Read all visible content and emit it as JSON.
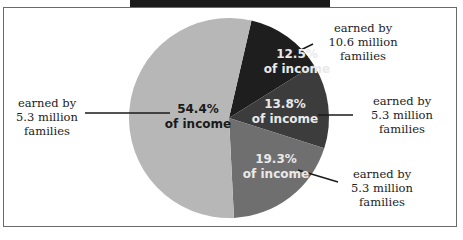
{
  "chart_data": {
    "type": "pie",
    "title": "",
    "slices": [
      {
        "label": "earned by 10.6 million families",
        "value": 12.5,
        "value_label": "12.5%",
        "sub_label": "of income",
        "color": "#1e1e1e"
      },
      {
        "label": "earned by 5.3 million families",
        "value": 13.8,
        "value_label": "13.8%",
        "sub_label": "of income",
        "color": "#3c3c3c"
      },
      {
        "label": "earned by 5.3 million families",
        "value": 19.3,
        "value_label": "19.3%",
        "sub_label": "of income",
        "color": "#6f6f6f"
      },
      {
        "label": "earned by 5.3 million families",
        "value": 54.4,
        "value_label": "54.4%",
        "sub_label": "of income",
        "color": "#b7b7b7"
      }
    ],
    "start_angle_deg": 13,
    "direction": "clockwise"
  },
  "callouts": [
    {
      "line1": "earned by",
      "line2": "10.6 million",
      "line3": "families"
    },
    {
      "line1": "earned by",
      "line2": "5.3 million",
      "line3": "families"
    },
    {
      "line1": "earned by",
      "line2": "5.3 million",
      "line3": "families"
    },
    {
      "line1": "earned by",
      "line2": "5.3 million",
      "line3": "families"
    }
  ]
}
